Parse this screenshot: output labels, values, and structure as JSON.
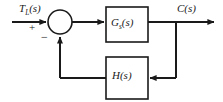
{
  "diagram": {
    "type": "control-system-block-diagram",
    "input_signal": {
      "base": "T",
      "subscript": "L",
      "argument": "(s)",
      "full": "T_L(s)"
    },
    "output_signal": {
      "base": "C",
      "subscript": "",
      "argument": "(s)",
      "full": "C(s)"
    },
    "summing_junction": {
      "name": "summing-junction",
      "input_sign": "+",
      "feedback_sign": "−"
    },
    "forward_block": {
      "base": "G",
      "subscript": "s",
      "argument": "(s)",
      "full": "G_s(s)"
    },
    "feedback_block": {
      "base": "H",
      "subscript": "",
      "argument": "(s)",
      "full": "H(s)"
    },
    "colors": {
      "line": "#1a1a1a",
      "background": "#ffffff",
      "text": "#1a1a1a"
    }
  }
}
